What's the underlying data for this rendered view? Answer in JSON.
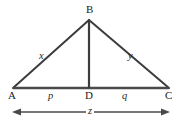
{
  "figure": {
    "background_color": "#ffffff",
    "stroke_color": "#3c3c3c",
    "label_color": "#1c1c1c",
    "vertices": {
      "A": {
        "label": "A",
        "x": 13,
        "y": 88
      },
      "B": {
        "label": "B",
        "x": 89,
        "y": 20
      },
      "C": {
        "label": "C",
        "x": 169,
        "y": 88
      },
      "D": {
        "label": "D",
        "x": 89,
        "y": 88
      }
    },
    "segment_labels": {
      "x": "x",
      "y": "y",
      "p": "p",
      "q": "q",
      "z": "z"
    },
    "dimension_arrow": {
      "label": "z",
      "from_x": 13,
      "to_x": 169,
      "y": 112,
      "double_headed": true
    }
  }
}
